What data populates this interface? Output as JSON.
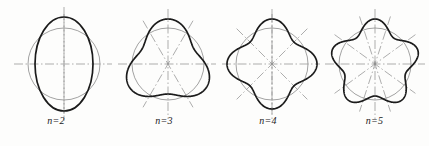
{
  "document": {
    "kind": "engineering-curve-figure-set",
    "background_color": "#fdfdfc",
    "ink_color": "#1b1b1b",
    "construction_color": "#8a8a8a",
    "centerline_color": "#8a8a8a"
  },
  "figures": [
    {
      "id": "fig-n2",
      "caption": "n=2",
      "n": 2,
      "lobes": 2,
      "center": {
        "x": 64,
        "y": 64
      },
      "circle_radius": 36,
      "curve_type": "ellipse",
      "ellipse_rx": 29,
      "ellipse_ry": 47,
      "axis_angles_deg": [
        0,
        90
      ],
      "centerline_overshoot": 14
    },
    {
      "id": "fig-n3",
      "caption": "n=3",
      "n": 3,
      "lobes": 3,
      "center": {
        "x": 168,
        "y": 64
      },
      "circle_radius": 36,
      "curve_type": "rounded-polygon",
      "lobe_outer_radius": 45,
      "lobe_inner_radius": 30,
      "lobe_phase_deg": -90,
      "axis_angles_deg": [
        0,
        60,
        120
      ],
      "centerline_overshoot": 14
    },
    {
      "id": "fig-n4",
      "caption": "n=4",
      "n": 4,
      "lobes": 4,
      "center": {
        "x": 272,
        "y": 64
      },
      "circle_radius": 36,
      "curve_type": "rounded-polygon",
      "lobe_outer_radius": 45,
      "lobe_inner_radius": 31,
      "lobe_phase_deg": -90,
      "axis_angles_deg": [
        0,
        45,
        90,
        135
      ],
      "centerline_overshoot": 14
    },
    {
      "id": "fig-n5",
      "caption": "n=5",
      "n": 5,
      "lobes": 5,
      "center": {
        "x": 375,
        "y": 64
      },
      "circle_radius": 36,
      "curve_type": "rounded-polygon",
      "lobe_outer_radius": 45,
      "lobe_inner_radius": 32,
      "lobe_phase_deg": -90,
      "axis_angles_deg": [
        0,
        36,
        72,
        108,
        144
      ],
      "centerline_overshoot": 14
    }
  ],
  "styles": {
    "curve_stroke_width": 1.7,
    "circle_stroke_width": 0.8,
    "centerline_stroke_width": 0.7,
    "centerline_dash": "9 2.5 1.5 2.5"
  }
}
